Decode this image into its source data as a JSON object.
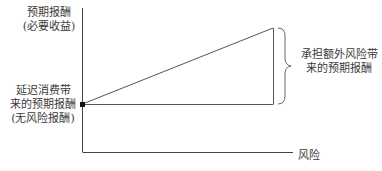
{
  "diagram": {
    "type": "risk-return relationship",
    "y_axis_label": {
      "line1": "预期报酬",
      "line2": "(必要收益)"
    },
    "x_axis_label": "风险",
    "risk_free_label": {
      "line1": "延迟消费带",
      "line2": "来的预期报酬",
      "line3": "(无风险报酬)"
    },
    "risk_premium_label": {
      "line1": "承担额外风险带",
      "line2": "来的预期报酬"
    },
    "colors": {
      "line": "#555555",
      "axis": "#444444",
      "point": "#111111",
      "text": "#3a3a3a"
    }
  }
}
